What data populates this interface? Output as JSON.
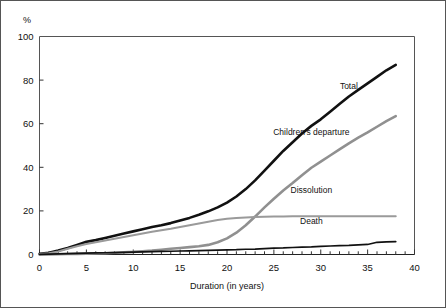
{
  "figure": {
    "frame_color": "#555555",
    "background": "#ffffff"
  },
  "chart_data": {
    "type": "line",
    "title": "",
    "xlabel": "Duration (in years)",
    "ylabel": "",
    "yunit": "%",
    "xlim": [
      0,
      40
    ],
    "ylim": [
      0,
      100
    ],
    "xticks": [
      0,
      5,
      10,
      15,
      20,
      25,
      30,
      35,
      40
    ],
    "xtick_labels": [
      "0",
      "5",
      "10",
      "15",
      "20",
      "25",
      "30",
      "35",
      "40"
    ],
    "xminor_step": 1,
    "yticks": [
      0,
      20,
      40,
      60,
      80,
      100
    ],
    "ytick_labels": [
      "0",
      "20",
      "40",
      "60",
      "80",
      "100"
    ],
    "grid": false,
    "legend_position": "inline-annotations",
    "x": [
      0,
      1,
      2,
      3,
      4,
      5,
      6,
      7,
      8,
      9,
      10,
      11,
      12,
      13,
      14,
      15,
      16,
      17,
      18,
      19,
      20,
      21,
      22,
      23,
      24,
      25,
      26,
      27,
      28,
      29,
      30,
      31,
      32,
      33,
      34,
      35,
      36,
      37,
      38
    ],
    "series": [
      {
        "name": "Total",
        "color": "#111111",
        "width": 2.6,
        "label_x": 33,
        "label_y": 76,
        "values": [
          0.3,
          0.8,
          1.8,
          3.0,
          4.4,
          5.8,
          6.6,
          7.6,
          8.6,
          9.6,
          10.6,
          11.6,
          12.6,
          13.4,
          14.4,
          15.6,
          16.8,
          18.2,
          19.8,
          21.6,
          23.8,
          26.6,
          30.0,
          34.0,
          38.5,
          43.0,
          47.5,
          51.5,
          55.5,
          59.0,
          62.0,
          65.5,
          69.0,
          72.5,
          75.5,
          78.5,
          81.5,
          84.5,
          87.0
        ]
      },
      {
        "name": "Children's departure",
        "color": "#909090",
        "width": 2.6,
        "label_x": 29,
        "label_y": 55,
        "values": [
          0.0,
          0.0,
          0.1,
          0.2,
          0.3,
          0.4,
          0.5,
          0.6,
          0.8,
          1.0,
          1.2,
          1.5,
          1.8,
          2.2,
          2.6,
          3.0,
          3.4,
          3.8,
          4.4,
          5.6,
          7.4,
          10.0,
          13.4,
          17.4,
          21.6,
          25.6,
          29.4,
          32.8,
          36.4,
          39.8,
          42.6,
          45.4,
          48.2,
          51.0,
          53.6,
          56.0,
          58.6,
          61.2,
          63.5
        ]
      },
      {
        "name": "Dissolution",
        "color": "#9a9a9a",
        "width": 2.0,
        "label_x": 29,
        "label_y": 28,
        "values": [
          0.2,
          0.6,
          1.4,
          2.6,
          3.8,
          4.8,
          5.6,
          6.4,
          7.2,
          8.0,
          8.8,
          9.6,
          10.4,
          11.1,
          11.8,
          12.6,
          13.4,
          14.2,
          15.0,
          15.8,
          16.4,
          16.8,
          17.0,
          17.2,
          17.3,
          17.4,
          17.4,
          17.5,
          17.5,
          17.5,
          17.5,
          17.5,
          17.5,
          17.5,
          17.5,
          17.5,
          17.5,
          17.5,
          17.5
        ]
      },
      {
        "name": "Death",
        "color": "#111111",
        "width": 1.7,
        "label_x": 29,
        "label_y": 14,
        "values": [
          0.1,
          0.2,
          0.3,
          0.4,
          0.5,
          0.6,
          0.7,
          0.8,
          0.9,
          1.0,
          1.1,
          1.2,
          1.3,
          1.4,
          1.5,
          1.6,
          1.7,
          1.8,
          1.9,
          2.0,
          2.1,
          2.2,
          2.4,
          2.5,
          2.7,
          2.9,
          3.0,
          3.2,
          3.4,
          3.5,
          3.7,
          3.9,
          4.1,
          4.2,
          4.4,
          4.6,
          5.6,
          5.8,
          5.9
        ]
      }
    ]
  }
}
